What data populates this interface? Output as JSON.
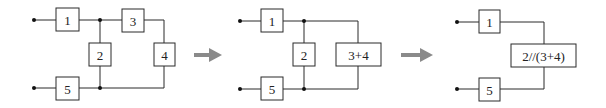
{
  "diagrams": [
    {
      "id": "original",
      "blocks": [
        {
          "label": "1"
        },
        {
          "label": "2"
        },
        {
          "label": "3"
        },
        {
          "label": "4"
        },
        {
          "label": "5"
        }
      ]
    },
    {
      "id": "step1",
      "blocks": [
        {
          "label": "1"
        },
        {
          "label": "2"
        },
        {
          "label": "3+4"
        },
        {
          "label": "5"
        }
      ]
    },
    {
      "id": "step2",
      "blocks": [
        {
          "label": "1"
        },
        {
          "label": "2//(3+4)"
        },
        {
          "label": "5"
        }
      ]
    }
  ],
  "arrows": [
    {
      "color": "#8a8a8a"
    },
    {
      "color": "#8a8a8a"
    }
  ]
}
